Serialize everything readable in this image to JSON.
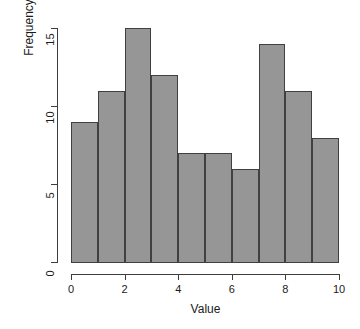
{
  "chart_data": {
    "type": "bar",
    "title": "",
    "subtitle": "",
    "xlabel": "Value",
    "ylabel": "Frequency",
    "xlim": [
      0,
      10
    ],
    "ylim": [
      0,
      15
    ],
    "grid": false,
    "legend": null,
    "bin_width": 1,
    "bin_edges": [
      0,
      1,
      2,
      3,
      4,
      5,
      6,
      7,
      8,
      9,
      10
    ],
    "categories": [
      "0-1",
      "1-2",
      "2-3",
      "3-4",
      "4-5",
      "5-6",
      "6-7",
      "7-8",
      "8-9",
      "9-10"
    ],
    "values": [
      9,
      11,
      15,
      12,
      7,
      7,
      6,
      14,
      11,
      8
    ],
    "x_ticks": [
      0,
      2,
      4,
      6,
      8,
      10
    ],
    "x_tick_labels": [
      "0",
      "2",
      "4",
      "6",
      "8",
      "10"
    ],
    "y_ticks": [
      0,
      5,
      10,
      15
    ],
    "y_tick_labels": [
      "0",
      "5",
      "10",
      "15"
    ],
    "bar_fill_color": "#969696",
    "bar_border_color": "#404040",
    "axis_color": "#3d3d3d",
    "background_color": "#ffffff"
  }
}
